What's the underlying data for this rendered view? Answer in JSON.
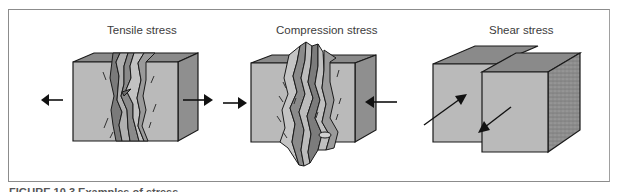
{
  "figure": {
    "panels": [
      {
        "id": "tensile",
        "title": "Tensile stress"
      },
      {
        "id": "compression",
        "title": "Compression stress"
      },
      {
        "id": "shear",
        "title": "Shear stress"
      }
    ],
    "caption": "FIGURE 10.3 Examples of stress"
  },
  "colors": {
    "front_face": "#bababa",
    "side_face": "#8f8f8f",
    "top_face": "#8a8a8a",
    "outline": "#1a1a1a",
    "crack_dark": "#7a7a7a",
    "frame": "#8c8c8c"
  }
}
